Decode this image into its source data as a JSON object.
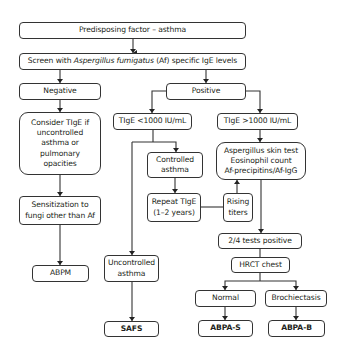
{
  "diagram": {
    "nodes": {
      "predisposing": {
        "label": "Predisposing factor – asthma"
      },
      "screen": {
        "label_pre": "Screen with ",
        "label_italic": "Aspergillus fumigatus",
        "label_post": " (Af) specific IgE levels"
      },
      "negative": {
        "label": "Negative"
      },
      "positive": {
        "label": "Positive"
      },
      "consider": {
        "lines": [
          "Consider TIgE if",
          "uncontrolled",
          "asthma or",
          "pulmonary",
          "opacities"
        ]
      },
      "sensitization": {
        "lines": [
          "Sensitization to",
          "fungi other than Af"
        ]
      },
      "abpm": {
        "label": "ABPM"
      },
      "tige_low": {
        "label": "TIgE <1000 IU/mL"
      },
      "tige_high": {
        "label": "TIgE >1000 IU/mL"
      },
      "controlled": {
        "lines": [
          "Controlled",
          "asthma"
        ]
      },
      "repeat": {
        "lines": [
          "Repeat TIgE",
          "(1–2 years)"
        ]
      },
      "rising": {
        "lines": [
          "Rising",
          "titers"
        ]
      },
      "tests": {
        "lines": [
          "Aspergillus skin test",
          "Eosinophil count",
          "Af-precipitins/Af-IgG"
        ]
      },
      "uncontrolled": {
        "lines": [
          "Uncontrolled",
          "asthma"
        ]
      },
      "safs": {
        "label": "SAFS"
      },
      "two_of_four": {
        "label": "2/4 tests positive"
      },
      "hrct": {
        "label": "HRCT chest"
      },
      "normal": {
        "label": "Normal"
      },
      "bronchiectasis": {
        "label": "Brochiectasis"
      },
      "abpa_s": {
        "label": "ABPA-S"
      },
      "abpa_b": {
        "label": "ABPA-B"
      }
    },
    "edges": [
      [
        "predisposing",
        "screen"
      ],
      [
        "screen",
        "negative"
      ],
      [
        "screen",
        "positive"
      ],
      [
        "negative",
        "consider"
      ],
      [
        "consider",
        "sensitization"
      ],
      [
        "sensitization",
        "abpm"
      ],
      [
        "positive",
        "tige_low"
      ],
      [
        "positive",
        "tige_high"
      ],
      [
        "tige_low",
        "controlled"
      ],
      [
        "tige_low",
        "uncontrolled"
      ],
      [
        "controlled",
        "repeat"
      ],
      [
        "repeat",
        "rising"
      ],
      [
        "rising",
        "tests"
      ],
      [
        "tige_high",
        "tests"
      ],
      [
        "tests",
        "two_of_four"
      ],
      [
        "uncontrolled",
        "safs"
      ],
      [
        "two_of_four",
        "hrct"
      ],
      [
        "hrct",
        "normal"
      ],
      [
        "hrct",
        "bronchiectasis"
      ],
      [
        "normal",
        "abpa_s"
      ],
      [
        "bronchiectasis",
        "abpa_b"
      ]
    ],
    "colors": {
      "stroke": "#333333",
      "text": "#231f20",
      "background": "#ffffff"
    }
  }
}
